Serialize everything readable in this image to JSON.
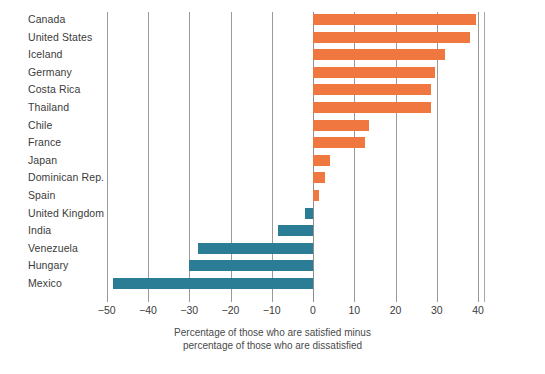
{
  "chart_data": {
    "type": "bar",
    "orientation": "horizontal",
    "title": "",
    "subtitle": "",
    "xlabel": "Percentage of those who are satisfied minus percentage of those who are dissatisfied",
    "ylabel": "",
    "xlim": [
      -50,
      41.5
    ],
    "ylim": [
      0,
      16
    ],
    "grid": true,
    "legend": "none",
    "xticks": [
      -50,
      -40,
      -30,
      -20,
      -10,
      0,
      10,
      20,
      30,
      40
    ],
    "xticklabels": [
      "−50",
      "−40",
      "−30",
      "−20",
      "−10",
      "0",
      "10",
      "20",
      "30",
      "40"
    ],
    "categories": [
      "Canada",
      "United States",
      "Iceland",
      "Germany",
      "Costa Rica",
      "Thailand",
      "Chile",
      "France",
      "Japan",
      "Dominican Rep.",
      "Spain",
      "United Kingdom",
      "India",
      "Venezuela",
      "Hungary",
      "Mexico"
    ],
    "values": [
      39.5,
      38,
      32,
      29.5,
      28.5,
      28.5,
      13.5,
      12.5,
      4,
      3,
      1.5,
      -2,
      -8.5,
      -28,
      -30,
      -48.5
    ],
    "colors": {
      "positive": "#F0773F",
      "negative": "#2A7D94",
      "gridline": "#9a9a9a",
      "text": "#3b3b3b",
      "background": "#ffffff"
    }
  },
  "axis_caption": {
    "line1": "Percentage of those who are satisfied minus",
    "line2": "percentage of those who are dissatisfied"
  }
}
